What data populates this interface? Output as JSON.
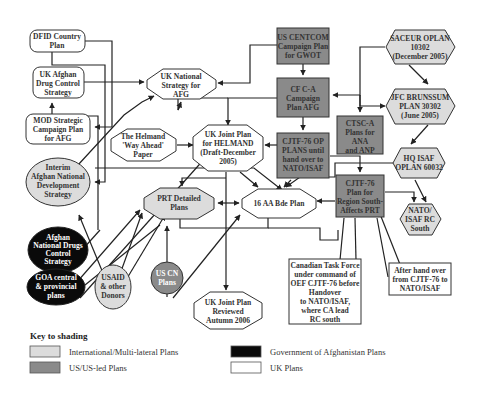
{
  "diagram": {
    "nodes": {
      "dfid": {
        "lines": [
          "DFID Country",
          "Plan"
        ],
        "category": "uk"
      },
      "uk_drug": {
        "lines": [
          "UK Afghan",
          "Drug Control",
          "Strategy"
        ],
        "category": "uk"
      },
      "mod": {
        "lines": [
          "MOD Strategic",
          "Campaign Plan",
          "for AFG"
        ],
        "category": "uk"
      },
      "iands": {
        "lines": [
          "Interim",
          "Afghan National",
          "Development",
          "Strategy"
        ],
        "category": "international"
      },
      "andcs": {
        "lines": [
          "Afghan",
          "National Drugs",
          "Control",
          "Strategy"
        ],
        "category": "goa"
      },
      "goa_central": {
        "lines": [
          "GOA central",
          "& provincial",
          "plans"
        ],
        "category": "goa"
      },
      "usaid": {
        "lines": [
          "USAID",
          "& other",
          "Donors"
        ],
        "category": "international"
      },
      "uscn": {
        "lines": [
          "US CN",
          "Plans"
        ],
        "category": "us"
      },
      "uk_national": {
        "lines": [
          "UK National",
          "Strategy for",
          "AFG"
        ],
        "category": "uk"
      },
      "helmand_way": {
        "lines": [
          "The Helmand",
          "'Way Ahead'",
          "Paper"
        ],
        "category": "uk"
      },
      "uk_joint": {
        "lines": [
          "UK Joint Plan",
          "for HELMAND",
          "(Draft-December",
          "2005)"
        ],
        "category": "uk"
      },
      "prt": {
        "lines": [
          "PRT Detailed",
          "Plans"
        ],
        "category": "international"
      },
      "bde16": {
        "lines": [
          "16 AA Bde Plan"
        ],
        "category": "uk"
      },
      "uk_joint_rev": {
        "lines": [
          "UK Joint Plan",
          "Reviewed",
          "Autumn 2006"
        ],
        "category": "uk"
      },
      "centcom": {
        "lines": [
          "US CENTCOM",
          "Campaign Plan",
          "for GWOT"
        ],
        "category": "us"
      },
      "cfca": {
        "lines": [
          "CF C-A",
          "Campaign",
          "Plan AFG"
        ],
        "category": "us"
      },
      "cjtf_op": {
        "lines": [
          "CJTF-76 OP",
          "PLANS until",
          "hand over to",
          "NATO/ISAF"
        ],
        "category": "us"
      },
      "ctsc": {
        "lines": [
          "CTSC-A",
          "Plans for",
          "ANA",
          "and ANP"
        ],
        "category": "us"
      },
      "cjtf_south": {
        "lines": [
          "CJTF-76",
          "Plan for",
          "Region South-",
          "Affects PRT"
        ],
        "category": "us"
      },
      "saceur": {
        "lines": [
          "SACEUR OPLAN",
          "10302",
          "(December 2005)"
        ],
        "category": "international"
      },
      "jfc": {
        "lines": [
          "JFC BRUNSSUM",
          "PLAN 30302",
          "(June 2005)"
        ],
        "category": "international"
      },
      "hqisaf": {
        "lines": [
          "HQ ISAF",
          "OPLAN 60032"
        ],
        "category": "international"
      },
      "rcsouth": {
        "lines": [
          "NATO/",
          "ISAF RC",
          "South"
        ],
        "category": "international"
      }
    },
    "callouts": {
      "canadian": {
        "lines": [
          "Canadian Task Force",
          "under command of",
          "OEF CJTF-76 before",
          "Handover",
          "to NATO/ISAF,",
          "where CA lead",
          "RC south"
        ]
      },
      "after_handover": {
        "lines": [
          "After hand over",
          "from CJTF-76 to",
          "NATO/ISAF"
        ]
      }
    }
  },
  "key": {
    "title": "Key to shading",
    "items": [
      {
        "label": "International/Multi-lateral Plans",
        "color": "#dcdcdc"
      },
      {
        "label": "US/US-led Plans",
        "color": "#8a8a8a"
      },
      {
        "label": "Government of Afghanistan Plans",
        "color": "#0a0a0a"
      },
      {
        "label": "UK Plans",
        "color": "#ffffff"
      }
    ]
  }
}
